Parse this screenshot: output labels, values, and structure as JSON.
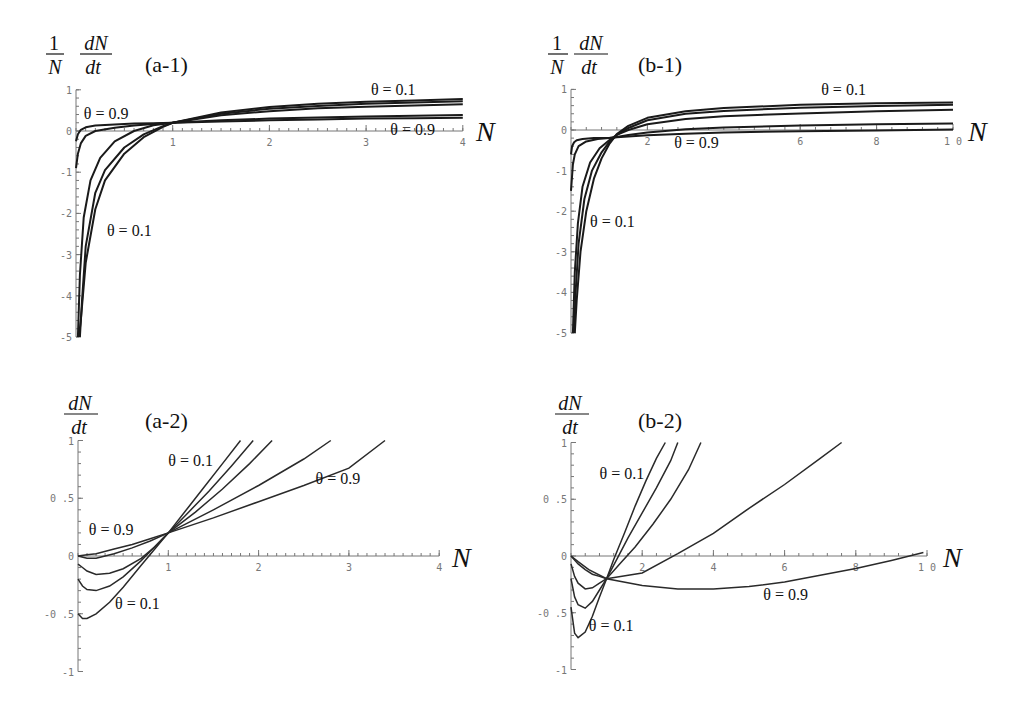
{
  "figure": {
    "panels": [
      {
        "id": "a-1",
        "tag": "(a-1)",
        "ylabel_num_left": "1",
        "ylabel_den_left": "N",
        "ylabel_num": "dN",
        "ylabel_den": "dt",
        "xlabel": "N"
      },
      {
        "id": "b-1",
        "tag": "(b-1)",
        "ylabel_num_left": "1",
        "ylabel_den_left": "N",
        "ylabel_num": "dN",
        "ylabel_den": "dt",
        "xlabel": "N"
      },
      {
        "id": "a-2",
        "tag": "(a-2)",
        "ylabel_num": "dN",
        "ylabel_den": "dt",
        "xlabel": "N"
      },
      {
        "id": "b-2",
        "tag": "(b-2)",
        "ylabel_num": "dN",
        "ylabel_den": "dt",
        "xlabel": "N"
      }
    ]
  },
  "chart_data": [
    {
      "id": "a-1",
      "type": "line",
      "title": "(a-1)",
      "xlabel": "N",
      "ylabel": "(1/N) dN/dt",
      "xlim": [
        0,
        4
      ],
      "ylim": [
        -5,
        1
      ],
      "xticks": [
        "1",
        "2",
        "3",
        "4"
      ],
      "yticks": [
        "1",
        "0",
        "-1",
        "-2",
        "-3",
        "-4",
        "-5"
      ],
      "grid": false,
      "annotations": [
        {
          "text": "θ = 0.1",
          "x": 3.05,
          "y": 0.88
        },
        {
          "text": "θ = 0.9",
          "x": 0.08,
          "y": 0.3
        },
        {
          "text": "θ = 0.9",
          "x": 3.25,
          "y": -0.1
        },
        {
          "text": "θ = 0.1",
          "x": 0.32,
          "y": -2.55
        }
      ],
      "series": [
        {
          "name": "θ = 0.1",
          "x": [
            0.03,
            0.05,
            0.1,
            0.2,
            0.3,
            0.5,
            0.7,
            0.9,
            1.0,
            1.5,
            2,
            2.5,
            3,
            3.5,
            4
          ],
          "y": [
            -5,
            -4.6,
            -3.2,
            -1.9,
            -1.2,
            -0.55,
            -0.15,
            0.1,
            0.2,
            0.45,
            0.58,
            0.66,
            0.71,
            0.74,
            0.78
          ]
        },
        {
          "name": "θ = 0.3",
          "x": [
            0.04,
            0.06,
            0.1,
            0.2,
            0.3,
            0.5,
            0.7,
            0.9,
            1.0,
            1.5,
            2,
            2.5,
            3,
            3.5,
            4
          ],
          "y": [
            -5,
            -4.2,
            -2.8,
            -1.5,
            -0.95,
            -0.4,
            -0.08,
            0.12,
            0.2,
            0.42,
            0.54,
            0.61,
            0.66,
            0.69,
            0.72
          ]
        },
        {
          "name": "θ = 0.5",
          "x": [
            0.02,
            0.04,
            0.08,
            0.15,
            0.25,
            0.4,
            0.6,
            0.8,
            1.0,
            1.5,
            2,
            2.5,
            3,
            3.5,
            4
          ],
          "y": [
            -5,
            -3.5,
            -2.1,
            -1.2,
            -0.65,
            -0.25,
            0.0,
            0.14,
            0.2,
            0.38,
            0.48,
            0.55,
            0.59,
            0.62,
            0.65
          ]
        },
        {
          "name": "θ = 0.7",
          "x": [
            0.0,
            0.02,
            0.05,
            0.1,
            0.2,
            0.4,
            0.6,
            0.8,
            1.0,
            1.5,
            2,
            2.5,
            3,
            3.5,
            4
          ],
          "y": [
            -0.9,
            -0.55,
            -0.3,
            -0.12,
            0.0,
            0.08,
            0.13,
            0.17,
            0.2,
            0.26,
            0.3,
            0.33,
            0.35,
            0.37,
            0.39
          ]
        },
        {
          "name": "θ = 0.9",
          "x": [
            0.0,
            0.02,
            0.05,
            0.1,
            0.2,
            0.4,
            0.6,
            0.8,
            1.0,
            1.5,
            2,
            2.5,
            3,
            3.5,
            4
          ],
          "y": [
            -0.25,
            -0.08,
            0.03,
            0.09,
            0.13,
            0.16,
            0.18,
            0.19,
            0.2,
            0.23,
            0.26,
            0.28,
            0.3,
            0.31,
            0.32
          ]
        }
      ]
    },
    {
      "id": "b-1",
      "type": "line",
      "title": "(b-1)",
      "xlabel": "N",
      "ylabel": "(1/N) dN/dt",
      "xlim": [
        0,
        10
      ],
      "ylim": [
        -5,
        1
      ],
      "xticks": [
        "2",
        "6",
        "8",
        "10"
      ],
      "yticks": [
        "1",
        "0",
        "-1",
        "-2",
        "-3",
        "-4",
        "-5"
      ],
      "grid": false,
      "annotations": [
        {
          "text": "θ = 0.1",
          "x": 6.55,
          "y": 0.86
        },
        {
          "text": "θ = 0.9",
          "x": 2.7,
          "y": -0.45
        },
        {
          "text": "θ = 0.1",
          "x": 0.5,
          "y": -2.4
        }
      ],
      "series": [
        {
          "name": "θ = 0.1",
          "x": [
            0.1,
            0.15,
            0.25,
            0.4,
            0.6,
            0.8,
            1.0,
            1.2,
            1.5,
            2,
            3,
            4,
            6,
            8,
            10
          ],
          "y": [
            -5,
            -4.2,
            -3.0,
            -2.0,
            -1.2,
            -0.7,
            -0.35,
            -0.1,
            0.1,
            0.3,
            0.46,
            0.54,
            0.62,
            0.66,
            0.68
          ]
        },
        {
          "name": "θ = 0.3",
          "x": [
            0.08,
            0.12,
            0.2,
            0.35,
            0.55,
            0.8,
            1.0,
            1.2,
            1.5,
            2,
            3,
            4,
            6,
            8,
            10
          ],
          "y": [
            -5,
            -4.0,
            -2.8,
            -1.7,
            -1.0,
            -0.55,
            -0.3,
            -0.12,
            0.05,
            0.24,
            0.4,
            0.47,
            0.55,
            0.59,
            0.62
          ]
        },
        {
          "name": "θ = 0.5",
          "x": [
            0.05,
            0.1,
            0.18,
            0.3,
            0.5,
            0.75,
            1.0,
            1.2,
            1.5,
            2,
            3,
            4,
            6,
            8,
            10
          ],
          "y": [
            -5,
            -3.5,
            -2.3,
            -1.4,
            -0.8,
            -0.45,
            -0.25,
            -0.12,
            0.0,
            0.14,
            0.27,
            0.34,
            0.41,
            0.46,
            0.5
          ]
        },
        {
          "name": "θ = 0.7",
          "x": [
            0.0,
            0.05,
            0.1,
            0.2,
            0.4,
            0.7,
            1.0,
            1.2,
            1.5,
            2,
            3,
            4,
            6,
            8,
            10
          ],
          "y": [
            -1.5,
            -0.85,
            -0.6,
            -0.4,
            -0.28,
            -0.22,
            -0.2,
            -0.17,
            -0.12,
            -0.06,
            0.02,
            0.06,
            0.11,
            0.14,
            0.16
          ]
        },
        {
          "name": "θ = 0.9",
          "x": [
            0.0,
            0.03,
            0.08,
            0.15,
            0.3,
            0.6,
            1.0,
            1.2,
            1.5,
            2,
            3,
            4,
            6,
            8,
            10
          ],
          "y": [
            -0.6,
            -0.4,
            -0.3,
            -0.25,
            -0.22,
            -0.2,
            -0.2,
            -0.18,
            -0.16,
            -0.13,
            -0.09,
            -0.06,
            -0.03,
            -0.01,
            0.01
          ]
        }
      ]
    },
    {
      "id": "a-2",
      "type": "line",
      "title": "(a-2)",
      "xlabel": "N",
      "ylabel": "dN/dt",
      "xlim": [
        0,
        4
      ],
      "ylim": [
        -1,
        1
      ],
      "xticks": [
        "1",
        "2",
        "3",
        "4"
      ],
      "yticks": [
        "1",
        "0.5",
        "0",
        "-0.5",
        "-1"
      ],
      "grid": false,
      "annotations": [
        {
          "text": "θ = 0.1",
          "x": 1.0,
          "y": 0.78
        },
        {
          "text": "θ = 0.9",
          "x": 2.63,
          "y": 0.62
        },
        {
          "text": "θ = 0.9",
          "x": 0.12,
          "y": 0.18
        },
        {
          "text": "θ = 0.1",
          "x": 0.41,
          "y": -0.46
        }
      ],
      "series": [
        {
          "name": "θ = 0.1",
          "x": [
            0.0,
            0.05,
            0.1,
            0.2,
            0.35,
            0.5,
            0.7,
            0.85,
            1.0,
            1.2,
            1.4,
            1.6,
            1.8
          ],
          "y": [
            -0.5,
            -0.54,
            -0.54,
            -0.5,
            -0.4,
            -0.27,
            -0.08,
            0.06,
            0.2,
            0.4,
            0.6,
            0.8,
            1.0
          ]
        },
        {
          "name": "θ = 0.3",
          "x": [
            0.0,
            0.05,
            0.1,
            0.2,
            0.35,
            0.5,
            0.7,
            0.85,
            1.0,
            1.2,
            1.45,
            1.7,
            1.94
          ],
          "y": [
            -0.2,
            -0.26,
            -0.29,
            -0.3,
            -0.26,
            -0.18,
            -0.04,
            0.08,
            0.2,
            0.36,
            0.56,
            0.78,
            1.0
          ]
        },
        {
          "name": "θ = 0.5",
          "x": [
            0.0,
            0.05,
            0.1,
            0.2,
            0.35,
            0.5,
            0.7,
            0.85,
            1.0,
            1.3,
            1.6,
            1.9,
            2.15
          ],
          "y": [
            -0.07,
            -0.1,
            -0.13,
            -0.16,
            -0.15,
            -0.11,
            -0.02,
            0.08,
            0.2,
            0.38,
            0.58,
            0.8,
            1.0
          ]
        },
        {
          "name": "θ = 0.7",
          "x": [
            0.0,
            0.1,
            0.2,
            0.4,
            0.6,
            0.8,
            1.0,
            1.5,
            2.0,
            2.5,
            2.8
          ],
          "y": [
            0.0,
            -0.02,
            -0.02,
            0.02,
            0.07,
            0.13,
            0.2,
            0.4,
            0.61,
            0.84,
            1.0
          ]
        },
        {
          "name": "θ = 0.9",
          "x": [
            0.0,
            0.1,
            0.2,
            0.4,
            0.6,
            0.8,
            1.0,
            1.5,
            2.0,
            2.5,
            3.0,
            3.4
          ],
          "y": [
            0.0,
            0.01,
            0.02,
            0.06,
            0.1,
            0.15,
            0.2,
            0.33,
            0.47,
            0.61,
            0.76,
            1.0
          ]
        }
      ]
    },
    {
      "id": "b-2",
      "type": "line",
      "title": "(b-2)",
      "xlabel": "N",
      "ylabel": "dN/dt",
      "xlim": [
        0,
        10
      ],
      "ylim": [
        -1,
        1
      ],
      "xticks": [
        "2",
        "4",
        "6",
        "8",
        "10"
      ],
      "yticks": [
        "1",
        "0.5",
        "0",
        "-0.5",
        "-1"
      ],
      "grid": false,
      "annotations": [
        {
          "text": "θ = 0.1",
          "x": 0.8,
          "y": 0.68
        },
        {
          "text": "θ = 0.9",
          "x": 5.4,
          "y": -0.39
        },
        {
          "text": "θ = 0.1",
          "x": 0.5,
          "y": -0.66
        }
      ],
      "series": [
        {
          "name": "θ = 0.1",
          "x": [
            0.0,
            0.1,
            0.2,
            0.4,
            0.6,
            0.8,
            1.0,
            1.2,
            1.5,
            1.8,
            2.1,
            2.4,
            2.65
          ],
          "y": [
            -0.45,
            -0.68,
            -0.72,
            -0.67,
            -0.53,
            -0.36,
            -0.2,
            -0.03,
            0.2,
            0.44,
            0.66,
            0.86,
            1.0
          ]
        },
        {
          "name": "θ = 0.3",
          "x": [
            0.0,
            0.1,
            0.2,
            0.4,
            0.6,
            0.8,
            1.0,
            1.3,
            1.6,
            2.0,
            2.4,
            2.8,
            3.0
          ],
          "y": [
            -0.2,
            -0.36,
            -0.43,
            -0.46,
            -0.4,
            -0.3,
            -0.2,
            -0.02,
            0.16,
            0.38,
            0.6,
            0.84,
            1.0
          ]
        },
        {
          "name": "θ = 0.5",
          "x": [
            0.0,
            0.1,
            0.2,
            0.4,
            0.6,
            0.8,
            1.0,
            1.4,
            1.8,
            2.3,
            2.8,
            3.3,
            3.65
          ],
          "y": [
            -0.07,
            -0.18,
            -0.24,
            -0.29,
            -0.28,
            -0.24,
            -0.2,
            -0.06,
            0.08,
            0.28,
            0.5,
            0.76,
            1.0
          ]
        },
        {
          "name": "θ = 0.7",
          "x": [
            0.0,
            0.2,
            0.4,
            0.6,
            0.8,
            1.0,
            2.0,
            3.0,
            4.0,
            5.0,
            6.0,
            7.0,
            7.6
          ],
          "y": [
            0.0,
            -0.07,
            -0.12,
            -0.16,
            -0.18,
            -0.2,
            -0.15,
            0.02,
            0.2,
            0.42,
            0.63,
            0.86,
            1.0
          ]
        },
        {
          "name": "θ = 0.9",
          "x": [
            0.0,
            0.2,
            0.5,
            1.0,
            2.0,
            3.0,
            4.0,
            5.0,
            6.0,
            7.0,
            8.0,
            9.0,
            9.9
          ],
          "y": [
            0.0,
            -0.05,
            -0.12,
            -0.2,
            -0.26,
            -0.29,
            -0.29,
            -0.27,
            -0.23,
            -0.17,
            -0.11,
            -0.04,
            0.03
          ]
        }
      ]
    }
  ]
}
